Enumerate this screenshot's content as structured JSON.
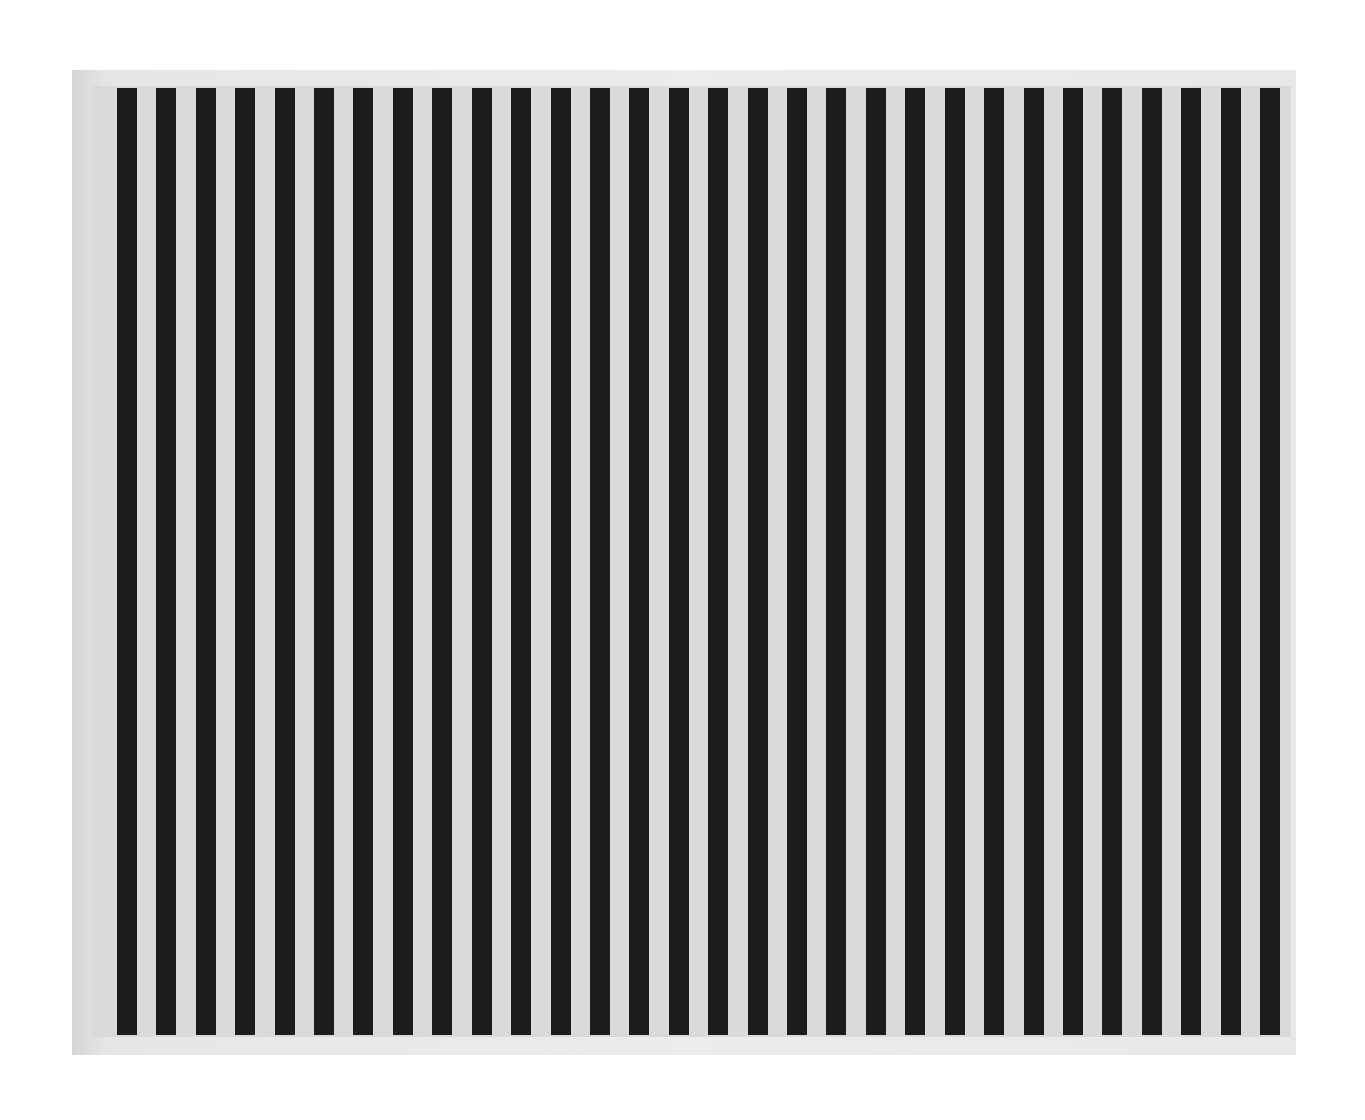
{
  "artwork": {
    "description": "Photograph of a painting with vertical black and light grey stripes",
    "stripe_count": 30,
    "colors": {
      "background": "#ffffff",
      "frame_shadow": "#e8e8e8",
      "canvas_light": "#d9d9d9",
      "stripe_dark": "#1c1c1c"
    }
  }
}
